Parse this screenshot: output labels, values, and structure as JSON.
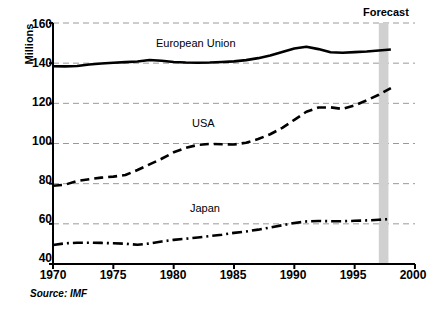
{
  "chart_data": {
    "type": "line",
    "title": "",
    "subtitle": "",
    "xlabel": "",
    "ylabel": "Millions",
    "xlim": [
      1970,
      2000
    ],
    "ylim": [
      40,
      160
    ],
    "xticks": [
      "1970",
      "1975",
      "1980",
      "1985",
      "1990",
      "1995",
      "2000"
    ],
    "yticks": [
      "40",
      "60",
      "80",
      "100",
      "120",
      "140",
      "160"
    ],
    "grid": "horizontal-dashed",
    "legend": "inline-labels",
    "annotations": [
      {
        "name": "forecast-label",
        "text": "Forecast",
        "x": 1997.6,
        "note": "label above shaded forecast band"
      },
      {
        "name": "forecast-band",
        "text": "",
        "x_start": 1997.0,
        "x_end": 1997.8,
        "color": "#d0d0d0"
      }
    ],
    "source_note": "Source: IMF",
    "x": [
      1970,
      1971,
      1972,
      1973,
      1974,
      1975,
      1976,
      1977,
      1978,
      1979,
      1980,
      1981,
      1982,
      1983,
      1984,
      1985,
      1986,
      1987,
      1988,
      1989,
      1990,
      1991,
      1992,
      1993,
      1994,
      1995,
      1996,
      1997,
      1998
    ],
    "series": [
      {
        "name": "European Union",
        "label_text": "European Union",
        "style": "solid",
        "color": "#000000",
        "values": [
          138.5,
          138.4,
          138.6,
          139.3,
          139.8,
          140.2,
          140.5,
          140.8,
          141.6,
          141.2,
          140.6,
          140.3,
          140.2,
          140.3,
          140.6,
          140.9,
          141.5,
          142.5,
          143.8,
          145.6,
          147.3,
          148.2,
          147.0,
          145.4,
          145.2,
          145.5,
          145.8,
          146.3,
          146.8
        ]
      },
      {
        "name": "USA",
        "label_text": "USA",
        "style": "dashed",
        "color": "#000000",
        "values": [
          79.0,
          79.5,
          81.3,
          82.2,
          83.0,
          83.5,
          84.3,
          86.8,
          89.6,
          92.4,
          95.6,
          97.8,
          99.3,
          99.8,
          99.6,
          99.5,
          100.4,
          102.2,
          104.6,
          107.8,
          111.8,
          115.8,
          117.9,
          118.0,
          117.2,
          119.0,
          121.5,
          124.3,
          127.6
        ]
      },
      {
        "name": "Japan",
        "label_text": "Japan",
        "style": "dash-dot",
        "color": "#000000",
        "values": [
          49.5,
          50.3,
          50.6,
          50.6,
          50.5,
          50.3,
          50.1,
          49.6,
          50.2,
          51.2,
          52.0,
          52.6,
          53.2,
          53.9,
          54.6,
          55.5,
          56.2,
          57.1,
          58.2,
          59.3,
          60.4,
          61.2,
          61.4,
          61.3,
          61.3,
          61.5,
          61.7,
          62.0,
          62.4
        ]
      }
    ],
    "series_label_positions": [
      {
        "name": "European Union",
        "x_px": 195,
        "y_px": 43
      },
      {
        "name": "USA",
        "x_px": 207,
        "y_px": 124
      },
      {
        "name": "Japan",
        "x_px": 207,
        "y_px": 209
      }
    ]
  },
  "axis": {
    "y_title": "Millions",
    "source": "Source: IMF",
    "forecast_label": "Forecast"
  }
}
